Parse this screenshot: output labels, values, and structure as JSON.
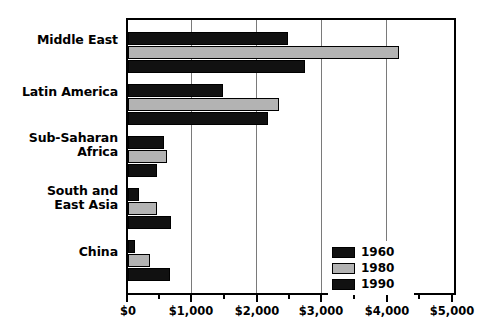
{
  "chart_data": {
    "type": "bar",
    "orientation": "horizontal",
    "title": "",
    "subtitle": "",
    "xlabel": "",
    "ylabel": "",
    "xlim": [
      0,
      5000
    ],
    "grid": true,
    "grid_axis": "x",
    "legend_position": "inside-lower-right",
    "categories": [
      "Middle East",
      "Latin America",
      "Sub-Saharan\nAfrica",
      "South and\nEast Asia",
      "China"
    ],
    "series": [
      {
        "name": "1960",
        "color": "#111111",
        "values": [
          2450,
          1450,
          550,
          170,
          110
        ]
      },
      {
        "name": "1980",
        "color": "#b3b3b3",
        "values": [
          4150,
          2320,
          600,
          450,
          340
        ]
      },
      {
        "name": "1990",
        "color": "#111111",
        "values": [
          2720,
          2140,
          450,
          660,
          640
        ]
      }
    ],
    "xticks": [
      0,
      1000,
      2000,
      3000,
      4000,
      5000
    ],
    "xtick_labels": [
      "$0",
      "$1,000",
      "$2,000",
      "$3,000",
      "$4,000",
      "$5,000"
    ],
    "xminor_ticks": [
      500,
      1500,
      2500,
      3500,
      4500
    ]
  },
  "legend": {
    "items": [
      {
        "label": "1960"
      },
      {
        "label": "1980"
      },
      {
        "label": "1990"
      }
    ]
  },
  "axis": {
    "tick_labels": [
      "$0",
      "$1,000",
      "$2,000",
      "$3,000",
      "$4,000",
      "$5,000"
    ]
  },
  "categories": {
    "labels": [
      "Middle East",
      "Latin America",
      "Sub-Saharan\nAfrica",
      "South and\nEast Asia",
      "China"
    ]
  },
  "colors": {
    "series_1960": "#111111",
    "series_1980": "#b3b3b3",
    "series_1990": "#111111",
    "gridline": "#7a7a7a",
    "border": "#000000",
    "background": "#ffffff"
  }
}
